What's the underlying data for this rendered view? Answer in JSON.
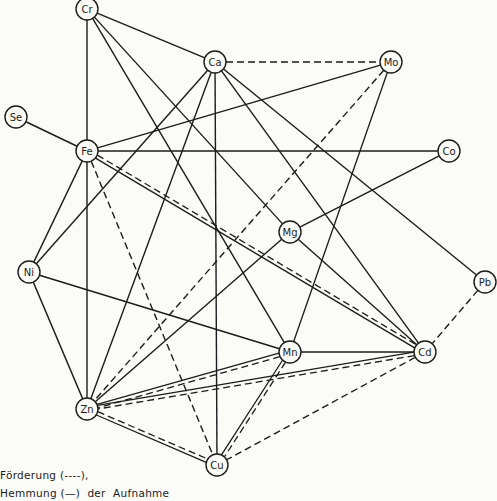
{
  "diagram": {
    "type": "network",
    "stroke_color": "#1c1c1c",
    "background": "#fbfbf8",
    "nodes": [
      {
        "id": "Cr",
        "label": "Cr",
        "x": 87,
        "y": 9
      },
      {
        "id": "Ca",
        "label": "Ca",
        "x": 215,
        "y": 62
      },
      {
        "id": "Mo",
        "label": "Mo",
        "x": 391,
        "y": 62
      },
      {
        "id": "Se",
        "label": "Se",
        "x": 16,
        "y": 117
      },
      {
        "id": "Fe",
        "label": "Fe",
        "x": 87,
        "y": 151
      },
      {
        "id": "Co",
        "label": "Co",
        "x": 449,
        "y": 151
      },
      {
        "id": "Mg",
        "label": "Mg",
        "x": 290,
        "y": 232
      },
      {
        "id": "Ni",
        "label": "Ni",
        "x": 29,
        "y": 272
      },
      {
        "id": "Pb",
        "label": "Pb",
        "x": 485,
        "y": 282
      },
      {
        "id": "Mn",
        "label": "Mn",
        "x": 290,
        "y": 352
      },
      {
        "id": "Cd",
        "label": "Cd",
        "x": 425,
        "y": 352
      },
      {
        "id": "Zn",
        "label": "Zn",
        "x": 87,
        "y": 409
      },
      {
        "id": "Cu",
        "label": "Cu",
        "x": 217,
        "y": 465
      }
    ],
    "edges": [
      {
        "from": "Cr",
        "to": "Ca",
        "style": "solid"
      },
      {
        "from": "Cr",
        "to": "Fe",
        "style": "solid"
      },
      {
        "from": "Cr",
        "to": "Mg",
        "style": "solid"
      },
      {
        "from": "Cr",
        "to": "Mn",
        "style": "solid"
      },
      {
        "from": "Ca",
        "to": "Mo",
        "style": "dashed"
      },
      {
        "from": "Ca",
        "to": "Ni",
        "style": "solid"
      },
      {
        "from": "Ca",
        "to": "Zn",
        "style": "solid"
      },
      {
        "from": "Ca",
        "to": "Cu",
        "style": "solid"
      },
      {
        "from": "Ca",
        "to": "Cd",
        "style": "solid"
      },
      {
        "from": "Ca",
        "to": "Pb",
        "style": "solid"
      },
      {
        "from": "Mo",
        "to": "Fe",
        "style": "solid"
      },
      {
        "from": "Mo",
        "to": "Zn",
        "style": "dashed"
      },
      {
        "from": "Mo",
        "to": "Mn",
        "style": "solid"
      },
      {
        "from": "Se",
        "to": "Fe",
        "style": "solid"
      },
      {
        "from": "Fe",
        "to": "Co",
        "style": "solid"
      },
      {
        "from": "Fe",
        "to": "Cd",
        "style": "both"
      },
      {
        "from": "Fe",
        "to": "Cu",
        "style": "dashed"
      },
      {
        "from": "Fe",
        "to": "Zn",
        "style": "solid"
      },
      {
        "from": "Fe",
        "to": "Ni",
        "style": "solid"
      },
      {
        "from": "Co",
        "to": "Mg",
        "style": "solid"
      },
      {
        "from": "Mg",
        "to": "Zn",
        "style": "solid"
      },
      {
        "from": "Mg",
        "to": "Cd",
        "style": "solid"
      },
      {
        "from": "Ni",
        "to": "Mn",
        "style": "solid"
      },
      {
        "from": "Ni",
        "to": "Zn",
        "style": "solid"
      },
      {
        "from": "Pb",
        "to": "Cd",
        "style": "dashed"
      },
      {
        "from": "Mn",
        "to": "Cd",
        "style": "solid"
      },
      {
        "from": "Mn",
        "to": "Zn",
        "style": "both"
      },
      {
        "from": "Mn",
        "to": "Cu",
        "style": "both"
      },
      {
        "from": "Cd",
        "to": "Zn",
        "style": "both"
      },
      {
        "from": "Cd",
        "to": "Cu",
        "style": "dashed"
      },
      {
        "from": "Zn",
        "to": "Cu",
        "style": "both"
      }
    ]
  },
  "legend": {
    "line1": "Förderung (----),",
    "line2": "Hemmung (—)  der  Aufnahme"
  }
}
